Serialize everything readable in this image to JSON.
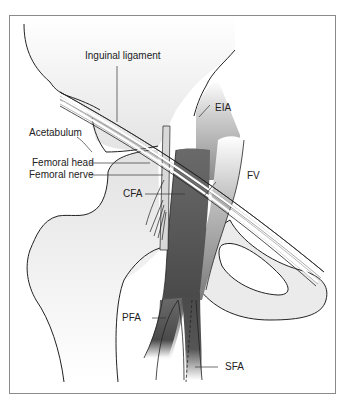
{
  "figure": {
    "type": "anatomical-diagram",
    "colors": {
      "frame": "#8a8a8a",
      "bone_fill": "#ebebeb",
      "outline": "#222222",
      "artery": "#4a4a4a",
      "vein": "#7a7a7a",
      "nerve": "#c8c8c8",
      "ligament": "#ffffff"
    },
    "labels": {
      "inguinal_ligament": "Inguinal ligament",
      "acetabulum": "Acetabulum",
      "femoral_head": "Femoral head",
      "femoral_nerve": "Femoral nerve",
      "cfa": "CFA",
      "eia": "EIA",
      "fv": "FV",
      "pfa": "PFA",
      "sfa": "SFA"
    }
  }
}
